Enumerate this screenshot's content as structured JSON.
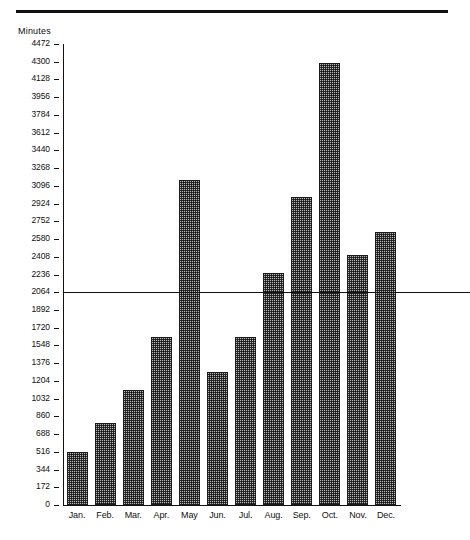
{
  "header": {
    "rule": "horizontal-rule"
  },
  "chart_data": {
    "type": "bar",
    "title": "",
    "xlabel": "",
    "ylabel": "Minutes",
    "ylim": [
      0,
      4472
    ],
    "ytick_step": 172,
    "grid": false,
    "legend": null,
    "categories": [
      "Jan.",
      "Feb.",
      "Mar.",
      "Apr.",
      "May",
      "Jun.",
      "Jul.",
      "Aug.",
      "Sep.",
      "Oct.",
      "Nov.",
      "Dec."
    ],
    "values": [
      516,
      800,
      1118,
      1634,
      3150,
      1290,
      1634,
      2253,
      2990,
      4286,
      2425,
      2650
    ],
    "yticks": [
      0,
      172,
      344,
      516,
      688,
      860,
      1032,
      1204,
      1376,
      1548,
      1720,
      1892,
      2064,
      2236,
      2408,
      2580,
      2752,
      2924,
      3096,
      3268,
      3440,
      3612,
      3784,
      3956,
      4128,
      4300,
      4472
    ],
    "ytick_labels": [
      "0",
      "172",
      "344",
      "516",
      "688",
      "860",
      "1032",
      "1204",
      "1376",
      "1548",
      "1720",
      "1892",
      "2064",
      "2236",
      "2408",
      "2580",
      "2752",
      "2924",
      "3096",
      "3268",
      "3440",
      "3612",
      "3784",
      "3956",
      "4128",
      "4300",
      "4472"
    ],
    "annotations": [
      {
        "name": "average-line",
        "label": "Avg. 2068",
        "value": 2068
      }
    ],
    "colors": {
      "bar_fill": "#b9b9b9",
      "bar_border": "#1a1a1a",
      "axis": "#111111",
      "text": "#111111"
    }
  }
}
